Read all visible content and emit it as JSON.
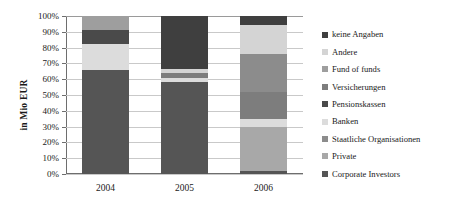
{
  "chart_data": {
    "type": "bar",
    "title": "",
    "subtitle": "",
    "stacked": true,
    "normalized_percent": true,
    "xlabel": "",
    "ylabel": "in Mio EUR",
    "categories": [
      "2004",
      "2005",
      "2006"
    ],
    "ylim": [
      0,
      100
    ],
    "ytick_labels": [
      "100%",
      "90%",
      "80%",
      "70%",
      "60%",
      "50%",
      "40%",
      "30%",
      "20%",
      "10%",
      "0%"
    ],
    "ytick_values": [
      100,
      90,
      80,
      70,
      60,
      50,
      40,
      30,
      20,
      10,
      0
    ],
    "grid": true,
    "legend_position": "right",
    "series": [
      {
        "name": "keine Angaben",
        "color": "#3f3f3f",
        "values": [
          0.0,
          33.5,
          6.0
        ]
      },
      {
        "name": "Andere",
        "color": "#d4d4d4",
        "values": [
          0.0,
          2.5,
          18.0
        ]
      },
      {
        "name": "Fund of funds",
        "color": "#9e9e9e",
        "values": [
          9.0,
          0.0,
          0.0
        ]
      },
      {
        "name": "Versicherungen",
        "color": "#7d7d7d",
        "values": [
          0.0,
          3.0,
          17.0
        ]
      },
      {
        "name": "Pensionskassen",
        "color": "#4a4a4a",
        "values": [
          9.0,
          0.0,
          0.0
        ]
      },
      {
        "name": "Banken",
        "color": "#dcdcdc",
        "values": [
          16.0,
          2.5,
          5.0
        ]
      },
      {
        "name": "Staatliche Organisationen",
        "color": "#8c8c8c",
        "values": [
          0.0,
          0.0,
          24.0
        ]
      },
      {
        "name": "Private",
        "color": "#a8a8a8",
        "values": [
          0.0,
          0.0,
          28.0
        ]
      },
      {
        "name": "Corporate Investors",
        "color": "#555555",
        "values": [
          66.0,
          58.5,
          2.0
        ]
      }
    ],
    "stacks": [
      {
        "category": "2004",
        "segments": [
          {
            "name": "Corporate Investors",
            "color": "#555555",
            "start": 0,
            "end": 66.0
          },
          {
            "name": "Banken",
            "color": "#dcdcdc",
            "start": 66.0,
            "end": 82.0
          },
          {
            "name": "Pensionskassen",
            "color": "#4a4a4a",
            "start": 82.0,
            "end": 91.0
          },
          {
            "name": "Fund of funds",
            "color": "#9e9e9e",
            "start": 91.0,
            "end": 100.0
          }
        ]
      },
      {
        "category": "2005",
        "segments": [
          {
            "name": "Corporate Investors",
            "color": "#555555",
            "start": 0,
            "end": 58.5
          },
          {
            "name": "Banken",
            "color": "#dcdcdc",
            "start": 58.5,
            "end": 61.0
          },
          {
            "name": "Versicherungen",
            "color": "#7d7d7d",
            "start": 61.0,
            "end": 64.0
          },
          {
            "name": "Andere",
            "color": "#d4d4d4",
            "start": 64.0,
            "end": 66.5
          },
          {
            "name": "keine Angaben",
            "color": "#3f3f3f",
            "start": 66.5,
            "end": 100.0
          }
        ]
      },
      {
        "category": "2006",
        "segments": [
          {
            "name": "Corporate Investors",
            "color": "#555555",
            "start": 0,
            "end": 2.0
          },
          {
            "name": "Private",
            "color": "#a8a8a8",
            "start": 2.0,
            "end": 30.0
          },
          {
            "name": "Banken",
            "color": "#dcdcdc",
            "start": 30.0,
            "end": 35.0
          },
          {
            "name": "Versicherungen",
            "color": "#7d7d7d",
            "start": 35.0,
            "end": 52.0
          },
          {
            "name": "Staatliche Organisationen",
            "color": "#8c8c8c",
            "start": 52.0,
            "end": 76.0
          },
          {
            "name": "Andere",
            "color": "#d4d4d4",
            "start": 76.0,
            "end": 94.0
          },
          {
            "name": "keine Angaben",
            "color": "#3f3f3f",
            "start": 94.0,
            "end": 100.0
          }
        ]
      }
    ]
  }
}
